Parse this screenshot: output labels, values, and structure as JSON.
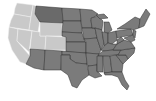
{
  "map": {
    "title": "United States",
    "colors": {
      "highlight_light": "#c9c9c9",
      "default": "#7b7b7b",
      "emphasis": "#6a6a6a",
      "border": "#2e2e2e",
      "background": "#ffffff"
    },
    "light_states": [
      "Washington",
      "Oregon",
      "California",
      "Nevada",
      "Idaho",
      "Utah",
      "Wyoming",
      "Colorado"
    ],
    "emphasis_states": [
      "Montana"
    ]
  }
}
